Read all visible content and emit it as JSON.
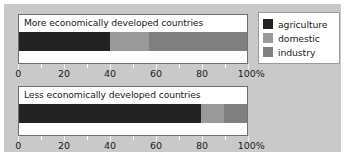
{
  "colors": {
    "background": "#c9c9c9",
    "panel": "#ffffff",
    "agriculture": "#232323",
    "domestic": "#9a9a9a",
    "industry": "#808080",
    "axis_text": "#1c1c1c",
    "panel_border": "#6f6f6f",
    "legend_border": "#9a9a9a"
  },
  "legend": {
    "position": "top-right",
    "items": [
      {
        "label": "agriculture",
        "color": "#232323",
        "swatch_name": "legend-swatch-agriculture"
      },
      {
        "label": "domestic",
        "color": "#9a9a9a",
        "swatch_name": "legend-swatch-domestic"
      },
      {
        "label": "industry",
        "color": "#808080",
        "swatch_name": "legend-swatch-industry"
      }
    ]
  },
  "axis": {
    "tick_labels": [
      "0",
      "20",
      "40",
      "60",
      "80",
      "100%"
    ],
    "tick_values": [
      0,
      20,
      40,
      60,
      80,
      100
    ],
    "minor_tick_values": [
      10,
      30,
      50,
      70,
      90
    ],
    "min": 0,
    "max": 100,
    "unit": "%"
  },
  "panels": [
    {
      "id": "medc",
      "title": "More economically developed countries",
      "segments": [
        {
          "name": "agriculture",
          "value": 40,
          "color": "#232323"
        },
        {
          "name": "domestic",
          "value": 17,
          "color": "#9a9a9a"
        },
        {
          "name": "industry",
          "value": 43,
          "color": "#808080"
        }
      ]
    },
    {
      "id": "ledc",
      "title": "Less economically developed countries",
      "segments": [
        {
          "name": "agriculture",
          "value": 80,
          "color": "#232323"
        },
        {
          "name": "domestic",
          "value": 10,
          "color": "#9a9a9a"
        },
        {
          "name": "industry",
          "value": 10,
          "color": "#808080"
        }
      ]
    }
  ],
  "chart_data": {
    "type": "bar",
    "orientation": "horizontal",
    "stacked": true,
    "stack_mode": "percent",
    "title": "",
    "xlabel": "",
    "ylabel": "",
    "xlim": [
      0,
      100
    ],
    "grid": false,
    "legend_position": "top-right",
    "categories": [
      "More economically developed countries",
      "Less economically developed countries"
    ],
    "series": [
      {
        "name": "agriculture",
        "color": "#232323",
        "values": [
          40,
          80
        ]
      },
      {
        "name": "domestic",
        "color": "#9a9a9a",
        "values": [
          17,
          10
        ]
      },
      {
        "name": "industry",
        "color": "#808080",
        "values": [
          43,
          10
        ]
      }
    ],
    "tick_labels": [
      "0",
      "20",
      "40",
      "60",
      "80",
      "100%"
    ],
    "annotations": []
  }
}
